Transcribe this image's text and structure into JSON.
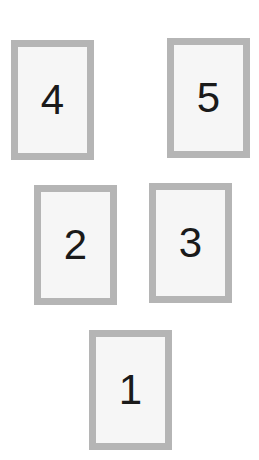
{
  "colors": {
    "background": "#ffffff",
    "card_border": "#b5b5b5",
    "card_fill": "#f6f6f6",
    "number": "#1a1a1a"
  },
  "cards": [
    {
      "label": "4",
      "x": 11,
      "y": 40
    },
    {
      "label": "5",
      "x": 167,
      "y": 38
    },
    {
      "label": "2",
      "x": 34,
      "y": 185
    },
    {
      "label": "3",
      "x": 149,
      "y": 183
    },
    {
      "label": "1",
      "x": 89,
      "y": 330
    }
  ]
}
